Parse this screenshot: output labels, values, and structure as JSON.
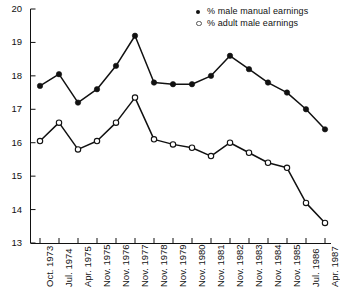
{
  "chart_data": {
    "type": "line",
    "title": "",
    "xlabel": "",
    "ylabel": "",
    "ylim": [
      13,
      20
    ],
    "yticks": [
      13,
      14,
      15,
      16,
      17,
      18,
      19,
      20
    ],
    "ytick_labels": [
      "13",
      "14",
      "15",
      "16",
      "17",
      "18",
      "19",
      "20"
    ],
    "grid": false,
    "legend_position": "top-right",
    "categories": [
      "Oct. 1973",
      "Jul. 1974",
      "Apr. 1975",
      "Nov. 1975",
      "Nov. 1976",
      "Nov. 1977",
      "Nov. 1978",
      "Nov. 1979",
      "Nov. 1980",
      "Nov. 1981",
      "Nov. 1982",
      "Nov. 1983",
      "Nov. 1984",
      "Nov. 1985",
      "Jul. 1986",
      "Apr. 1987"
    ],
    "series": [
      {
        "name": "% male manual earnings",
        "marker": "filled-circle",
        "color": "#111111",
        "values": [
          17.7,
          18.05,
          17.2,
          17.6,
          18.3,
          19.2,
          17.8,
          17.75,
          17.75,
          18.0,
          18.6,
          18.2,
          17.8,
          17.5,
          17.0,
          16.4
        ]
      },
      {
        "name": "% adult male earnings",
        "marker": "open-circle",
        "color": "#111111",
        "values": [
          16.05,
          16.6,
          15.8,
          16.05,
          16.6,
          17.35,
          16.1,
          15.95,
          15.85,
          15.6,
          16.0,
          15.7,
          15.4,
          15.25,
          14.2,
          13.6
        ]
      }
    ]
  },
  "legend": {
    "items": [
      {
        "label": "% male manual earnings",
        "marker": "filled-circle"
      },
      {
        "label": "% adult male earnings",
        "marker": "open-circle"
      }
    ]
  }
}
